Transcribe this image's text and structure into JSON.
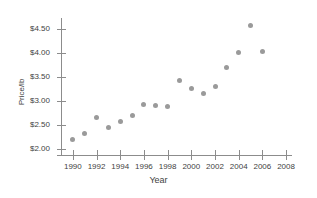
{
  "chart_data": {
    "type": "scatter",
    "title": "",
    "xlabel": "Year",
    "ylabel": "Price/lb",
    "xlim": [
      1989,
      2008.5
    ],
    "ylim": [
      1.88,
      4.72
    ],
    "grid": false,
    "legend": null,
    "x_ticks": [
      1990,
      1992,
      1994,
      1996,
      1998,
      2000,
      2002,
      2004,
      2006,
      2008
    ],
    "x_tick_labels": [
      "1990",
      "1992",
      "1994",
      "1996",
      "1998",
      "2000",
      "2002",
      "2004",
      "2006",
      "2008"
    ],
    "y_ticks": [
      2.0,
      2.5,
      3.0,
      3.5,
      4.0,
      4.5
    ],
    "y_tick_labels": [
      "$2.00",
      "$2.50",
      "$3.00",
      "$3.50",
      "$4.00",
      "$4.50"
    ],
    "point_color": "#9a9a9a",
    "axis_color": "#8c8c8c",
    "x": [
      1990,
      1991,
      1992,
      1993,
      1994,
      1995,
      1996,
      1997,
      1998,
      1999,
      2000,
      2001,
      2002,
      2003,
      2004,
      2005,
      2006
    ],
    "values": [
      2.2,
      2.33,
      2.65,
      2.45,
      2.57,
      2.7,
      2.92,
      2.91,
      2.88,
      3.42,
      3.25,
      3.15,
      3.29,
      3.7,
      4.0,
      4.57,
      4.03
    ],
    "points": [
      {
        "x": 1990,
        "y": 2.2
      },
      {
        "x": 1991,
        "y": 2.33
      },
      {
        "x": 1992,
        "y": 2.65
      },
      {
        "x": 1993,
        "y": 2.45
      },
      {
        "x": 1994,
        "y": 2.57
      },
      {
        "x": 1995,
        "y": 2.7
      },
      {
        "x": 1996,
        "y": 2.92
      },
      {
        "x": 1997,
        "y": 2.91
      },
      {
        "x": 1998,
        "y": 2.88
      },
      {
        "x": 1999,
        "y": 3.42
      },
      {
        "x": 2000,
        "y": 3.25
      },
      {
        "x": 2001,
        "y": 3.15
      },
      {
        "x": 2002,
        "y": 3.29
      },
      {
        "x": 2003,
        "y": 3.7
      },
      {
        "x": 2004,
        "y": 4.0
      },
      {
        "x": 2005,
        "y": 4.57
      },
      {
        "x": 2006,
        "y": 4.03
      }
    ]
  }
}
